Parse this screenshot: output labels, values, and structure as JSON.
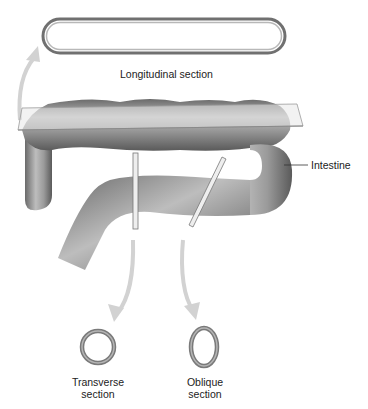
{
  "diagram": {
    "type": "anatomical-sectioning",
    "subject": "Intestine",
    "labels": {
      "longitudinal": "Longitudinal section",
      "intestine": "Intestine",
      "transverse_line1": "Transverse",
      "transverse_line2": "section",
      "oblique_line1": "Oblique",
      "oblique_line2": "section"
    },
    "colors": {
      "tube": "#8a8a8a",
      "tube_light": "#c4c4c4",
      "tube_dark": "#5e5e5e",
      "arrow": "#cfcfcf",
      "plane": "#e6e6e6",
      "text": "#222222"
    }
  }
}
